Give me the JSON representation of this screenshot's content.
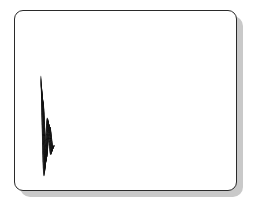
{
  "figure": {
    "panel": {
      "name": "figure-panel",
      "background_color": "#ffffff",
      "border_color": "#2a2a2a",
      "shadow_color": "#c9c9c9",
      "corner_radius_px": 9,
      "left_px": 14,
      "top_px": 10,
      "width_px": 223,
      "height_px": 181
    },
    "caption": "",
    "title": "",
    "axis_labels": {
      "x": "",
      "y": "",
      "z": ""
    },
    "tick_labels": [],
    "legend": [],
    "annotations": []
  },
  "chart_data": {
    "type": "line",
    "subtype": "3d-wireframe-mesh-surface",
    "title": "",
    "subtitle": "",
    "xlabel": "",
    "ylabel": "",
    "zlabel": "",
    "grid": true,
    "legend_position": "none",
    "surface_style": {
      "line_color": "#111111",
      "line_width": 0.42,
      "face_color": "#ffffff",
      "hidden_line_removal": true,
      "mesh_lines_u": 48,
      "mesh_lines_v": 44
    },
    "projection": {
      "kind": "oblique-axonometric",
      "azimuth_deg": -37,
      "elevation_deg": 28,
      "x_axis_screen": [
        3.62,
        1.42
      ],
      "y_axis_screen": [
        2.58,
        -1.22
      ],
      "z_axis_screen": [
        0.0,
        -1.0
      ],
      "origin_screen_px": [
        26,
        128
      ],
      "z_scale_px": 62
    },
    "function": {
      "expression": "z = exp(-0.55*x) * cos(3.35*x) * (0.30 + 0.70*exp(-1.15*y))",
      "description": "Damped travelling wave: oscillation in x decays left-to-right, amplitude also decays from the near edge to the far edge in y, flattening into a near-planar sheet at the right.",
      "x_domain": [
        0.0,
        3.0
      ],
      "y_domain": [
        0.0,
        1.0
      ],
      "z_range": [
        -0.72,
        1.0
      ],
      "samples_x": 48,
      "samples_y": 44
    },
    "features": [
      {
        "name": "leading-crest",
        "label": "thin left crest",
        "screen_px": [
          31,
          86
        ],
        "height": 0.46
      },
      {
        "name": "ridge-1",
        "label": "first full ridge",
        "screen_px": [
          72,
          60
        ],
        "height": 0.78
      },
      {
        "name": "peak-main",
        "label": "tallest peak",
        "screen_px": [
          107,
          28
        ],
        "height": 1.0
      },
      {
        "name": "trough-1",
        "label": "first trough",
        "screen_px": [
          62,
          133
        ],
        "height": -0.62
      },
      {
        "name": "trough-2",
        "label": "second trough",
        "screen_px": [
          96,
          152
        ],
        "height": -0.52
      },
      {
        "name": "trough-3",
        "label": "third trough",
        "screen_px": [
          132,
          166
        ],
        "height": -0.4
      },
      {
        "name": "trough-4",
        "label": "fourth trough",
        "screen_px": [
          168,
          160
        ],
        "height": -0.22
      },
      {
        "name": "flat-sheet",
        "label": "flattened right sheet",
        "screen_px": [
          212,
          90
        ],
        "height": 0.05
      }
    ],
    "categories": [],
    "values": []
  }
}
